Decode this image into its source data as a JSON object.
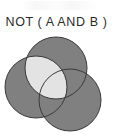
{
  "figure": {
    "title": "NOT ( A AND B )",
    "caption_expression": "NOT ( A AND B )",
    "operator": "NOT",
    "inner_operator": "AND",
    "operands": [
      "A",
      "B"
    ],
    "background_color": "#ffffff",
    "title_color": "#2b2b2b"
  },
  "diagram": {
    "type": "venn",
    "set_count": 3,
    "shaded_fill_color": "#808080",
    "highlight_fill_color": "#e3e3e3",
    "outline_color": "#3a3a3a",
    "outline_width": 1,
    "shaded_region_description": "everything outside A AND B",
    "highlight_region_description": "A intersect B (unshaded)",
    "circles": [
      {
        "label": "A",
        "name": "circle-top",
        "cx": 56,
        "cy": 36,
        "r": 31,
        "fill": "#808080"
      },
      {
        "label": "B",
        "name": "circle-left",
        "cx": 36,
        "cy": 55,
        "r": 31,
        "fill": "#808080"
      },
      {
        "label": "C",
        "name": "circle-bottom-right",
        "cx": 70,
        "cy": 68,
        "r": 31,
        "fill": "#808080"
      }
    ],
    "legend": [],
    "axis_labels": []
  },
  "icons": {
    "smudge": "scan-artifact-smudge"
  }
}
